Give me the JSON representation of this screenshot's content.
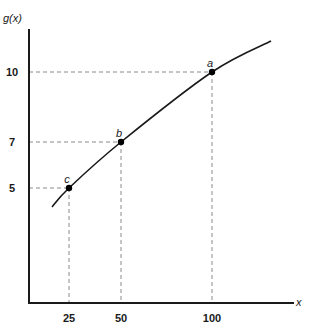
{
  "chart_data": {
    "type": "line",
    "title": "",
    "xlabel": "x",
    "ylabel": "g(x)",
    "grid": false,
    "legend": null,
    "x_ticks": [
      25,
      50,
      100
    ],
    "y_ticks": [
      5,
      7,
      10
    ],
    "xlim": [
      0,
      140
    ],
    "ylim": [
      0,
      13
    ],
    "series": [
      {
        "name": "g(x)",
        "style": "concave increasing curve",
        "x": [
          16,
          25,
          50,
          100,
          128
        ],
        "values": [
          4.5,
          5,
          7,
          10,
          11.4
        ]
      }
    ],
    "points": [
      {
        "label": "c",
        "x": 25,
        "y": 5
      },
      {
        "label": "b",
        "x": 50,
        "y": 7
      },
      {
        "label": "a",
        "x": 100,
        "y": 10
      }
    ],
    "annotations": "Dashed guide lines from each labeled point to both axes"
  },
  "colors": {
    "curve": "#1a1a1a",
    "axis": "#1a1a1a",
    "guide": "#8a8a8a",
    "background": "#ffffff"
  }
}
